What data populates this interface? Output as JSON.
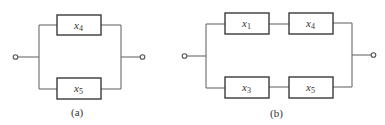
{
  "diagrams": {
    "a": {
      "caption": "(a)",
      "topology": "parallel",
      "blocks": [
        {
          "var": "x",
          "sub": "4",
          "branch": "upper"
        },
        {
          "var": "x",
          "sub": "5",
          "branch": "lower"
        }
      ]
    },
    "b": {
      "caption": "(b)",
      "topology": "parallel of two series branches",
      "blocks": [
        {
          "var": "x",
          "sub": "1",
          "branch": "upper",
          "position": 1
        },
        {
          "var": "x",
          "sub": "4",
          "branch": "upper",
          "position": 2
        },
        {
          "var": "x",
          "sub": "3",
          "branch": "lower",
          "position": 1
        },
        {
          "var": "x",
          "sub": "5",
          "branch": "lower",
          "position": 2
        }
      ]
    }
  },
  "colors": {
    "wire": "#6a6a6a",
    "box": "#3a3a3a",
    "text": "#333333",
    "background": "#ffffff"
  }
}
